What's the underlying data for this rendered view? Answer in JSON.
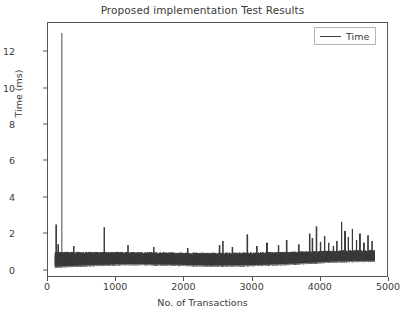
{
  "chart_data": {
    "type": "line",
    "title": "Proposed implementation Test Results",
    "xlabel": "No. of Transactions",
    "ylabel": "Time (ms)",
    "xlim": [
      0,
      5000
    ],
    "ylim": [
      -0.4,
      13.6
    ],
    "xticks": [
      0,
      1000,
      2000,
      3000,
      4000,
      5000
    ],
    "yticks": [
      0,
      2,
      4,
      6,
      8,
      10,
      12
    ],
    "grid": false,
    "legend": {
      "position": "upper right",
      "entries": [
        {
          "name": "Time",
          "color": "#3a3a3a"
        }
      ]
    },
    "series": [
      {
        "name": "Time",
        "color": "#3a3a3a",
        "description": "Per-transaction response time, dense oscillating band with occasional spikes",
        "x_start": 100,
        "x_end": 4820,
        "sample_count": 4720,
        "band_low": 0.08,
        "band_high": 0.95,
        "baseline_trend": [
          {
            "x": 100,
            "y": 0.22
          },
          {
            "x": 600,
            "y": 0.3
          },
          {
            "x": 1200,
            "y": 0.36
          },
          {
            "x": 1800,
            "y": 0.33
          },
          {
            "x": 2400,
            "y": 0.28
          },
          {
            "x": 3000,
            "y": 0.3
          },
          {
            "x": 3600,
            "y": 0.38
          },
          {
            "x": 4200,
            "y": 0.5
          },
          {
            "x": 4800,
            "y": 0.55
          }
        ],
        "band_top_trend": [
          {
            "x": 100,
            "y": 0.95
          },
          {
            "x": 800,
            "y": 0.95
          },
          {
            "x": 1600,
            "y": 0.92
          },
          {
            "x": 2400,
            "y": 0.9
          },
          {
            "x": 3200,
            "y": 0.92
          },
          {
            "x": 4000,
            "y": 1.0
          },
          {
            "x": 4800,
            "y": 1.05
          }
        ],
        "spikes": [
          {
            "x": 205,
            "y": 13.05
          },
          {
            "x": 120,
            "y": 2.45
          },
          {
            "x": 150,
            "y": 1.35
          },
          {
            "x": 380,
            "y": 1.25
          },
          {
            "x": 830,
            "y": 2.3
          },
          {
            "x": 1180,
            "y": 1.3
          },
          {
            "x": 1560,
            "y": 1.2
          },
          {
            "x": 2060,
            "y": 1.15
          },
          {
            "x": 2530,
            "y": 1.3
          },
          {
            "x": 2580,
            "y": 1.55
          },
          {
            "x": 2720,
            "y": 1.2
          },
          {
            "x": 2940,
            "y": 1.9
          },
          {
            "x": 3080,
            "y": 1.25
          },
          {
            "x": 3230,
            "y": 1.45
          },
          {
            "x": 3400,
            "y": 1.3
          },
          {
            "x": 3520,
            "y": 1.6
          },
          {
            "x": 3700,
            "y": 1.35
          },
          {
            "x": 3860,
            "y": 1.95
          },
          {
            "x": 3900,
            "y": 1.7
          },
          {
            "x": 3960,
            "y": 2.35
          },
          {
            "x": 4020,
            "y": 1.5
          },
          {
            "x": 4080,
            "y": 1.8
          },
          {
            "x": 4140,
            "y": 1.45
          },
          {
            "x": 4210,
            "y": 1.25
          },
          {
            "x": 4260,
            "y": 1.55
          },
          {
            "x": 4330,
            "y": 2.6
          },
          {
            "x": 4380,
            "y": 2.1
          },
          {
            "x": 4430,
            "y": 1.75
          },
          {
            "x": 4490,
            "y": 2.2
          },
          {
            "x": 4550,
            "y": 1.6
          },
          {
            "x": 4600,
            "y": 1.95
          },
          {
            "x": 4660,
            "y": 1.45
          },
          {
            "x": 4720,
            "y": 1.85
          },
          {
            "x": 4780,
            "y": 1.55
          }
        ],
        "max_value": 13.05,
        "min_value": 0.05
      }
    ]
  },
  "axis_colors": {
    "frame": "#555555",
    "text": "#3a3a3a",
    "background": "#ffffff"
  }
}
